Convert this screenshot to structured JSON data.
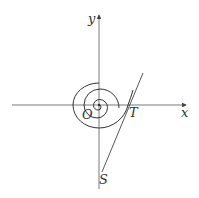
{
  "figure": {
    "type": "spiral-tangent-diagram",
    "labels": {
      "x_axis": "x",
      "y_axis": "y",
      "origin": "O",
      "point_T": "T",
      "point_S": "S"
    },
    "colors": {
      "stroke": "#444444",
      "background": "#ffffff"
    }
  }
}
